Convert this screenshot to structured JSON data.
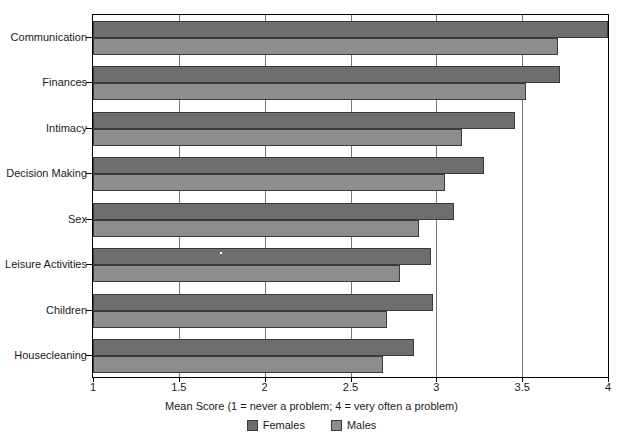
{
  "chart_data": {
    "type": "bar",
    "orientation": "horizontal",
    "title": "",
    "xlabel": "Mean Score (1 = never a problem; 4 = very often a problem)",
    "ylabel": "",
    "xlim": [
      1,
      4
    ],
    "xticks": [
      1,
      1.5,
      2,
      2.5,
      3,
      3.5,
      4
    ],
    "xtick_labels": [
      "1",
      "1.5",
      "2",
      "2.5",
      "3",
      "3.5",
      "4"
    ],
    "grid": true,
    "grid_axis": "x",
    "legend_position": "bottom-center",
    "categories": [
      "Communication",
      "Finances",
      "Intimacy",
      "Decision Making",
      "Sex",
      "Leisure Activities",
      "Children",
      "Housecleaning"
    ],
    "series": [
      {
        "name": "Females",
        "color": "#6e6e6e",
        "values": [
          4.0,
          3.72,
          3.46,
          3.28,
          3.1,
          2.97,
          2.98,
          2.87
        ]
      },
      {
        "name": "Males",
        "color": "#8d8d8d",
        "values": [
          3.71,
          3.52,
          3.15,
          3.05,
          2.9,
          2.79,
          2.71,
          2.69
        ]
      }
    ]
  },
  "legend": {
    "items": [
      {
        "label": "Females",
        "swatch": "females"
      },
      {
        "label": "Males",
        "swatch": "males"
      }
    ]
  },
  "caption": {
    "remnant": ""
  },
  "colors": {
    "females": "#6e6e6e",
    "males": "#8d8d8d",
    "axis": "#000000",
    "grid": "#777777",
    "background": "#ffffff"
  }
}
